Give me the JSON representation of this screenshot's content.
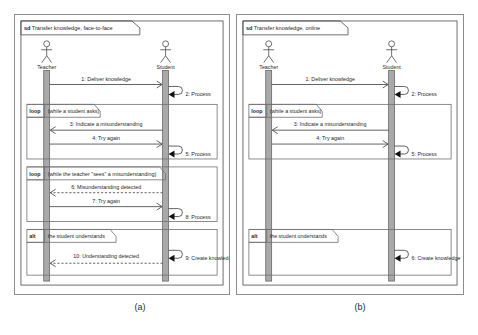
{
  "figure": {
    "caption_a": "(a)",
    "caption_b": "(b)"
  },
  "diagrams": [
    {
      "id": "a",
      "frame_keyword": "sd",
      "frame_title": "Transfer knowledge, face-to-face",
      "actors": [
        {
          "name": "Teacher"
        },
        {
          "name": "Student"
        }
      ],
      "messages": [
        {
          "num": "1",
          "label": "1: Deliver knowledge",
          "from": "Teacher",
          "to": "Student",
          "kind": "solid",
          "dir": "right"
        },
        {
          "num": "2",
          "label": "2: Process",
          "from": "Student",
          "to": "Student",
          "kind": "self",
          "dir": "self"
        },
        {
          "num": "3",
          "label": "3: Indicate a misunderstanding",
          "from": "Student",
          "to": "Teacher",
          "kind": "solid",
          "dir": "left"
        },
        {
          "num": "4",
          "label": "4: Try again",
          "from": "Teacher",
          "to": "Student",
          "kind": "solid",
          "dir": "right"
        },
        {
          "num": "5",
          "label": "5: Process",
          "from": "Student",
          "to": "Student",
          "kind": "self",
          "dir": "self"
        },
        {
          "num": "6",
          "label": "6: Misunderstanding detected",
          "from": "Student",
          "to": "Teacher",
          "kind": "dashed",
          "dir": "left"
        },
        {
          "num": "7",
          "label": "7: Try again",
          "from": "Teacher",
          "to": "Student",
          "kind": "solid",
          "dir": "right"
        },
        {
          "num": "8",
          "label": "8: Process",
          "from": "Student",
          "to": "Student",
          "kind": "self",
          "dir": "self"
        },
        {
          "num": "9",
          "label": "9: Create knowledge",
          "from": "Student",
          "to": "Student",
          "kind": "self",
          "dir": "self"
        },
        {
          "num": "10",
          "label": "10: Understanding detected",
          "from": "Student",
          "to": "Teacher",
          "kind": "dashed",
          "dir": "left"
        }
      ],
      "fragments": [
        {
          "operator": "loop",
          "guard": "(while a student asks)"
        },
        {
          "operator": "loop",
          "guard": "(while the teacher \"sees\" a misunderstanding)"
        },
        {
          "operator": "alt",
          "guard": "the student understands"
        }
      ]
    },
    {
      "id": "b",
      "frame_keyword": "sd",
      "frame_title": "Transfer knowledge, online",
      "actors": [
        {
          "name": "Teacher"
        },
        {
          "name": "Student"
        }
      ],
      "messages": [
        {
          "num": "1",
          "label": "1: Deliver knowledge",
          "from": "Teacher",
          "to": "Student",
          "kind": "solid",
          "dir": "right"
        },
        {
          "num": "2",
          "label": "2: Process",
          "from": "Student",
          "to": "Student",
          "kind": "self",
          "dir": "self"
        },
        {
          "num": "3",
          "label": "3: Indicate a misunderstanding",
          "from": "Student",
          "to": "Teacher",
          "kind": "solid",
          "dir": "left"
        },
        {
          "num": "4",
          "label": "4: Try again",
          "from": "Teacher",
          "to": "Student",
          "kind": "solid",
          "dir": "right"
        },
        {
          "num": "5",
          "label": "5: Process",
          "from": "Student",
          "to": "Student",
          "kind": "self",
          "dir": "self"
        },
        {
          "num": "6",
          "label": "6: Create knowledge",
          "from": "Student",
          "to": "Student",
          "kind": "self",
          "dir": "self"
        }
      ],
      "fragments": [
        {
          "operator": "loop",
          "guard": "(while a student asks)"
        },
        {
          "operator": "alt",
          "guard": "the student understands"
        }
      ]
    }
  ],
  "colors": {
    "line": "#4a4a4a",
    "activation": "#a9a9a9",
    "text": "#1f1f1f",
    "panel_border": "#8d8d8d",
    "background": "#ffffff"
  }
}
